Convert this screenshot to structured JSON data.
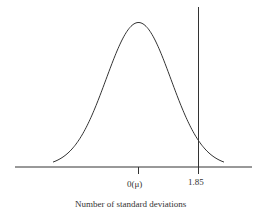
{
  "chart_data": {
    "type": "line",
    "title": "",
    "xlabel": "Number of standard deviations",
    "ylabel": "",
    "series": [
      {
        "name": "Normal distribution",
        "kind": "bell-curve",
        "mean": 0,
        "sd": 1
      }
    ],
    "tick_labels": [
      "0(μ)",
      "1.85"
    ],
    "annotations": [
      {
        "type": "vertical-line",
        "x": 1.85
      }
    ],
    "grid": false,
    "legend": "none"
  },
  "labels": {
    "mean_tick": "0(μ)",
    "cutoff_tick": "1.85",
    "x_axis_title": "Number of standard deviations"
  },
  "colors": {
    "line": "#333333",
    "background": "#ffffff"
  }
}
